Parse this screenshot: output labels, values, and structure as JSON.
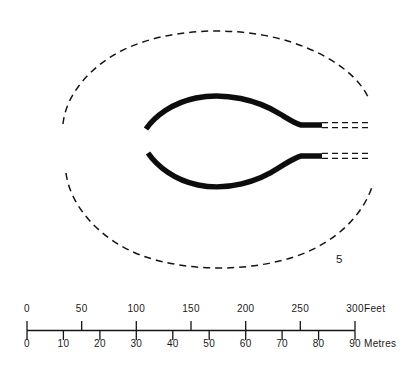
{
  "figure": {
    "number_label": "5",
    "type": "archaeological-site-plan",
    "ink_color": "#111111",
    "background_color": "#ffffff"
  },
  "plan": {
    "outer_boundary": {
      "name": "dashed-outer-enclosure",
      "style": "dashed",
      "shape": "lens-oval",
      "notes": "broken / conjectural outer ditch line, open at left and right"
    },
    "inner_features": [
      {
        "name": "upper-bank-arc",
        "style": "solid-thick",
        "notes": "heavy curved bank, terminal at west end, turns east to entrance"
      },
      {
        "name": "lower-bank-arc",
        "style": "solid-thick",
        "notes": "heavy curved bank, terminal at west end, turns east to entrance"
      },
      {
        "name": "upper-dashed-extension",
        "style": "dashed-band",
        "notes": "conjectural continuation of upper bank eastwards"
      },
      {
        "name": "lower-dashed-extension",
        "style": "dashed-band",
        "notes": "conjectural continuation of lower bank eastwards"
      }
    ]
  },
  "scale_bar": {
    "name": "dual-unit-scale-bar",
    "feet": {
      "unit_label": "Feet",
      "ticks": [
        "0",
        "50",
        "100",
        "150",
        "200",
        "250",
        "300"
      ],
      "tick_values": [
        0,
        50,
        100,
        150,
        200,
        250,
        300
      ],
      "max": 300
    },
    "metres": {
      "unit_label": "Metres",
      "ticks": [
        "0",
        "10",
        "20",
        "30",
        "40",
        "50",
        "60",
        "70",
        "80",
        "90"
      ],
      "tick_values": [
        0,
        10,
        20,
        30,
        40,
        50,
        60,
        70,
        80,
        90
      ],
      "max": 90
    }
  }
}
